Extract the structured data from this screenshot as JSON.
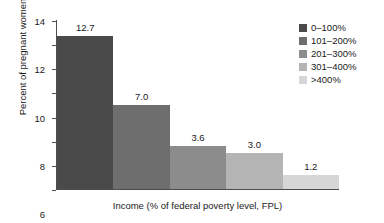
{
  "chart_data": {
    "type": "bar",
    "title": "",
    "xlabel": "Income (% of federal poverty level, FPL)",
    "ylabel": "Percent of pregnant women",
    "categories": [
      "0–100%",
      "101–200%",
      "201–300%",
      "301–400%",
      ">400%"
    ],
    "values": [
      12.7,
      7.0,
      3.6,
      3.0,
      1.2
    ],
    "value_labels": [
      "12.7",
      "7.0",
      "3.6",
      "3.0",
      "1.2"
    ],
    "colors": [
      "#4a4a4a",
      "#6e6e6e",
      "#8c8c8c",
      "#b4b4b4",
      "#d6d6d6"
    ],
    "ylim": [
      0,
      14
    ],
    "yticks": [
      0,
      2,
      4,
      6,
      8,
      10,
      12,
      14
    ],
    "ytick_labels": [
      "0",
      "2",
      "4",
      "6",
      "8",
      "10",
      "12",
      "14"
    ],
    "xtick_labels": [],
    "grid": false,
    "legend_position": "right",
    "legend_entries": [
      {
        "label": "0–100%",
        "color": "#4a4a4a"
      },
      {
        "label": "101–200%",
        "color": "#6e6e6e"
      },
      {
        "label": "201–300%",
        "color": "#8c8c8c"
      },
      {
        "label": "301–400%",
        "color": "#b4b4b4"
      },
      {
        "label": ">400%",
        "color": "#d6d6d6"
      }
    ]
  }
}
